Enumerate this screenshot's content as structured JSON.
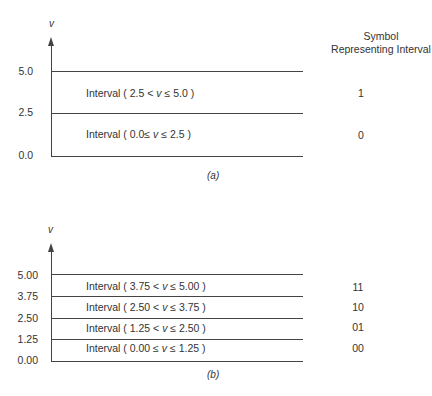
{
  "header": {
    "line1": "Symbol",
    "line2": "Representing Interval"
  },
  "diagram_a": {
    "axis_label": "v",
    "caption": "(a)",
    "ticks": [
      "5.0",
      "2.5",
      "0.0"
    ],
    "intervals": [
      {
        "pre": "Interval  ( 2.5 < ",
        "var": "v",
        "post": " ≤ 5.0 )",
        "symbol": "1"
      },
      {
        "pre": "Interval  ( 0.0≤  ",
        "var": "v",
        "post": " ≤ 2.5 )",
        "symbol": "0"
      }
    ]
  },
  "diagram_b": {
    "axis_label": "v",
    "caption": "(b)",
    "ticks": [
      "5.00",
      "3.75",
      "2.50",
      "1.25",
      "0.00"
    ],
    "intervals": [
      {
        "pre": "Interval  ( 3.75 < ",
        "var": "v",
        "post": " ≤ 5.00 )",
        "symbol": "11"
      },
      {
        "pre": "Interval  ( 2.50 < ",
        "var": "v",
        "post": " ≤ 3.75 )",
        "symbol": "10"
      },
      {
        "pre": "Interval  ( 1.25 < ",
        "var": "v",
        "post": " ≤ 2.50 )",
        "symbol": "01"
      },
      {
        "pre": "Interval  ( 0.00 ≤ ",
        "var": "v",
        "post": " ≤ 1.25 )",
        "symbol": "00"
      }
    ]
  }
}
